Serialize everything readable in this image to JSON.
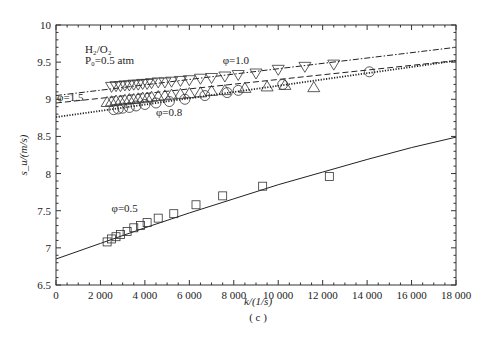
{
  "chart_data": {
    "type": "line",
    "title": "",
    "panel_label": "( c )",
    "xlabel": "k/(1/s)",
    "ylabel": "s_u/(m/s)",
    "xlim": [
      0,
      18000
    ],
    "ylim": [
      6.5,
      10
    ],
    "x_ticks": [
      0,
      2000,
      4000,
      6000,
      8000,
      10000,
      12000,
      14000,
      16000,
      18000
    ],
    "x_tick_labels": [
      "0",
      "2 000",
      "4 000",
      "6 000",
      "8 000",
      "10 000",
      "12 000",
      "14 000",
      "16 000",
      "18 000"
    ],
    "y_ticks": [
      6.5,
      7,
      7.5,
      8,
      8.5,
      9,
      9.5,
      10
    ],
    "y_tick_labels": [
      "6.5",
      "7",
      "7.5",
      "8",
      "8.5",
      "9",
      "9.5",
      "10"
    ],
    "grid": false,
    "annotations": [
      {
        "text": "H₂/O₂",
        "x": 1300,
        "y": 9.62
      },
      {
        "text": "P₀=0.5 atm",
        "x": 1300,
        "y": 9.47
      },
      {
        "text": "φ=1.0",
        "x": 7500,
        "y": 9.48
      },
      {
        "text": "φ=1.5",
        "x": 50,
        "y": 8.98
      },
      {
        "text": "φ=0.8",
        "x": 4500,
        "y": 8.78
      },
      {
        "text": "φ=0.5",
        "x": 2500,
        "y": 7.48
      }
    ],
    "series": [
      {
        "name": "φ=1.0",
        "marker": "triangle-down",
        "line_style": "dash-dot",
        "fit_line": {
          "x": [
            0,
            18000
          ],
          "y": [
            9.05,
            9.7
          ]
        },
        "points": {
          "x": [
            2500,
            2700,
            2900,
            3100,
            3300,
            3500,
            3700,
            3900,
            4100,
            4300,
            4600,
            4900,
            5200,
            5600,
            6000,
            6500,
            7000,
            7600,
            8200,
            9000,
            10000,
            11200,
            12500
          ],
          "y": [
            9.16,
            9.17,
            9.17,
            9.18,
            9.18,
            9.19,
            9.19,
            9.2,
            9.2,
            9.21,
            9.22,
            9.22,
            9.23,
            9.24,
            9.25,
            9.27,
            9.28,
            9.3,
            9.32,
            9.34,
            9.39,
            9.43,
            9.46
          ]
        }
      },
      {
        "name": "φ=1.5",
        "marker": "triangle-up",
        "line_style": "dashed",
        "fit_line": {
          "x": [
            0,
            18000
          ],
          "y": [
            8.95,
            9.52
          ]
        },
        "points": {
          "x": [
            2300,
            2500,
            2700,
            2900,
            3100,
            3300,
            3500,
            3700,
            3900,
            4100,
            4300,
            4600,
            4900,
            5200,
            5600,
            6000,
            6500,
            7000,
            7600,
            8500,
            9500,
            10300,
            11600
          ],
          "y": [
            8.97,
            8.98,
            8.99,
            8.99,
            9.0,
            9.01,
            9.01,
            9.02,
            9.03,
            9.03,
            9.04,
            9.05,
            9.06,
            9.07,
            9.08,
            9.09,
            9.1,
            9.12,
            9.13,
            9.16,
            9.18,
            9.2,
            9.17
          ]
        }
      },
      {
        "name": "φ=0.8",
        "marker": "circle",
        "line_style": "dotted",
        "fit_line": {
          "x": [
            0,
            18000
          ],
          "y": [
            8.76,
            9.52
          ]
        },
        "points": {
          "x": [
            2600,
            2800,
            3000,
            3300,
            3600,
            4000,
            4500,
            5100,
            5800,
            6700,
            7700,
            8200,
            10200,
            14100
          ],
          "y": [
            8.86,
            8.87,
            8.88,
            8.89,
            8.91,
            8.93,
            8.95,
            8.97,
            9.0,
            9.05,
            9.09,
            9.12,
            9.2,
            9.37
          ]
        }
      },
      {
        "name": "φ=0.5",
        "marker": "square",
        "line_style": "solid",
        "fit_line": {
          "x": [
            0,
            2000,
            4000,
            6000,
            8000,
            10000,
            12000,
            14000,
            16000,
            18000
          ],
          "y": [
            6.85,
            7.06,
            7.27,
            7.47,
            7.66,
            7.85,
            8.02,
            8.19,
            8.35,
            8.49
          ]
        },
        "points": {
          "x": [
            2300,
            2500,
            2700,
            2900,
            3200,
            3500,
            3800,
            4100,
            4600,
            5300,
            6300,
            7500,
            9300,
            12300
          ],
          "y": [
            7.08,
            7.12,
            7.15,
            7.18,
            7.22,
            7.27,
            7.3,
            7.34,
            7.4,
            7.46,
            7.58,
            7.7,
            7.83,
            7.96
          ]
        }
      }
    ]
  }
}
